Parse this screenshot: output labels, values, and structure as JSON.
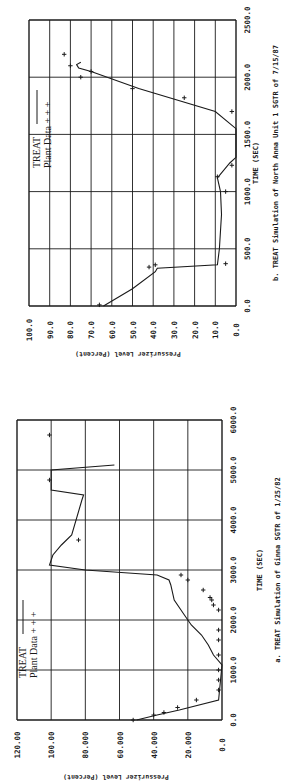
{
  "page": {
    "orientation": "rotated-90-ccw",
    "background": "#ffffff",
    "ink": "#1a1a1a"
  },
  "chart_data": [
    {
      "id": "b",
      "type": "line",
      "caption": "b.   TREAT Simulation of North Anna Unit 1 SGTR of 7/15/87",
      "title": "TREAT Simulation of North Anna Unit 1 SGTR of 7/15/87",
      "panel_label": "b.",
      "xlabel": "TIME (SEC)",
      "ylabel": "Pressurizer Level (Percent)",
      "xlim": [
        0,
        2500
      ],
      "ylim": [
        0,
        100
      ],
      "xticks": [
        "0.0",
        "500.0",
        "1000.0",
        "1500.0",
        "2000.0",
        "2500.0"
      ],
      "yticks": [
        "0.0",
        "10.0",
        "20.0",
        "30.0",
        "40.0",
        "50.0",
        "60.0",
        "70.0",
        "80.0",
        "90.0",
        "100.0"
      ],
      "grid": true,
      "legend": {
        "position": "upper-left",
        "entries": [
          {
            "label": "TREAT",
            "style": "line"
          },
          {
            "label": "Plant Data",
            "style": "+ + +"
          }
        ]
      },
      "series": [
        {
          "name": "TREAT",
          "style": "line",
          "x": [
            0,
            150,
            300,
            330,
            360,
            500,
            800,
            1000,
            1120,
            1250,
            1300,
            1550,
            1700,
            1900,
            2050,
            2080,
            2110,
            2130
          ],
          "y": [
            64,
            50,
            39,
            38,
            9,
            8,
            7,
            7.5,
            9,
            3,
            0,
            0,
            10,
            47,
            70,
            76,
            77,
            75
          ]
        },
        {
          "name": "Plant Data",
          "style": "markers",
          "x": [
            10,
            340,
            360,
            370,
            1000,
            1130,
            1230,
            1700,
            1820,
            1900,
            2000,
            2050,
            2100,
            2200
          ],
          "y": [
            66,
            42,
            39,
            5,
            5,
            9,
            2,
            2,
            25,
            50,
            75,
            70,
            80,
            83
          ]
        }
      ]
    },
    {
      "id": "a",
      "type": "line",
      "caption": "a.   TREAT Simulation of Ginna SGTR of 1/25/82",
      "title": "TREAT Simulation of Ginna SGTR of 1/25/82",
      "panel_label": "a.",
      "xlabel": "TIME (SEC)",
      "ylabel": "Pressurizer Level (Percent)",
      "xlim": [
        0,
        6000
      ],
      "ylim": [
        0,
        120
      ],
      "xticks": [
        "0.0",
        "1000.0",
        "2000.0",
        "3000.0",
        "4000.0",
        "5000.0",
        "6000.0"
      ],
      "yticks": [
        "0.0",
        "20.000",
        "40.000",
        "60.000",
        "80.000",
        "100.00",
        "120.00"
      ],
      "grid": true,
      "legend": {
        "position": "upper-left",
        "entries": [
          {
            "label": "TREAT",
            "style": "line"
          },
          {
            "label": "Plant Data",
            "style": "+ + +"
          }
        ]
      },
      "series": [
        {
          "name": "TREAT",
          "style": "line",
          "x": [
            0,
            100,
            200,
            400,
            1100,
            1300,
            1500,
            1700,
            1900,
            2100,
            2400,
            2700,
            2800,
            2900,
            3000,
            3100,
            3300,
            3500,
            3700,
            4400,
            4500,
            4600,
            5000,
            5100
          ],
          "y": [
            50,
            38,
            25,
            2,
            0,
            5,
            8,
            12,
            18,
            22,
            28,
            30,
            31,
            38,
            80,
            101,
            99,
            94,
            88,
            82,
            81,
            100,
            100,
            63
          ]
        },
        {
          "name": "Plant Data",
          "style": "markers",
          "x": [
            0,
            100,
            150,
            250,
            400,
            600,
            800,
            1000,
            1300,
            1600,
            1800,
            2200,
            2300,
            2400,
            2450,
            2600,
            2800,
            2900,
            3600,
            4800,
            5700
          ],
          "y": [
            52,
            40,
            34,
            26,
            15,
            2,
            2,
            2,
            2,
            2,
            2,
            2,
            5,
            6,
            7,
            11,
            20,
            24,
            84,
            101,
            101
          ]
        }
      ]
    }
  ]
}
